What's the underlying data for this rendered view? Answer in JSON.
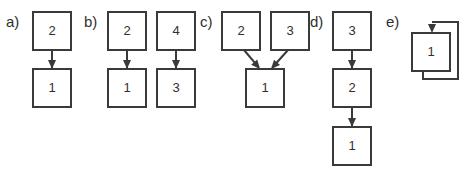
{
  "figure": {
    "background_color": "#ffffff",
    "stroke_color": "#3a3a3a",
    "text_color": "#2f2f2f",
    "panels": [
      {
        "label": "a)",
        "label_x": 6,
        "label_y": 27,
        "nodes": [
          {
            "id": "a2",
            "text": "2",
            "x": 33,
            "y": 12,
            "w": 38,
            "h": 38
          },
          {
            "id": "a1",
            "text": "1",
            "x": 33,
            "y": 69,
            "w": 38,
            "h": 38
          }
        ],
        "edges": [
          {
            "from": "a2",
            "to": "a1",
            "kind": "straight-down",
            "x": 52,
            "y1": 50,
            "y2": 69
          }
        ]
      },
      {
        "label": "b)",
        "label_x": 84,
        "label_y": 27,
        "nodes": [
          {
            "id": "b2",
            "text": "2",
            "x": 108,
            "y": 12,
            "w": 38,
            "h": 38
          },
          {
            "id": "b4",
            "text": "4",
            "x": 157,
            "y": 12,
            "w": 38,
            "h": 38
          },
          {
            "id": "b1",
            "text": "1",
            "x": 108,
            "y": 69,
            "w": 38,
            "h": 38
          },
          {
            "id": "b3",
            "text": "3",
            "x": 157,
            "y": 69,
            "w": 38,
            "h": 38
          }
        ],
        "edges": [
          {
            "from": "b2",
            "to": "b1",
            "kind": "straight-down",
            "x": 127,
            "y1": 50,
            "y2": 69
          },
          {
            "from": "b4",
            "to": "b3",
            "kind": "straight-down",
            "x": 176,
            "y1": 50,
            "y2": 69
          }
        ]
      },
      {
        "label": "c)",
        "label_x": 200,
        "label_y": 27,
        "nodes": [
          {
            "id": "c2",
            "text": "2",
            "x": 222,
            "y": 12,
            "w": 38,
            "h": 38
          },
          {
            "id": "c3",
            "text": "3",
            "x": 271,
            "y": 12,
            "w": 38,
            "h": 38
          },
          {
            "id": "c1",
            "text": "1",
            "x": 246,
            "y": 69,
            "w": 38,
            "h": 38
          }
        ],
        "edges": [
          {
            "from": "c2",
            "to": "c1",
            "kind": "diagonal",
            "x1": 244,
            "y1": 50,
            "x2": 260,
            "y2": 69
          },
          {
            "from": "c3",
            "to": "c1",
            "kind": "diagonal",
            "x1": 288,
            "y1": 50,
            "x2": 271,
            "y2": 69
          }
        ]
      },
      {
        "label": "d)",
        "label_x": 310,
        "label_y": 27,
        "nodes": [
          {
            "id": "d3",
            "text": "3",
            "x": 333,
            "y": 12,
            "w": 38,
            "h": 38
          },
          {
            "id": "d2",
            "text": "2",
            "x": 333,
            "y": 69,
            "w": 38,
            "h": 38
          },
          {
            "id": "d1",
            "text": "1",
            "x": 333,
            "y": 127,
            "w": 38,
            "h": 38
          }
        ],
        "edges": [
          {
            "from": "d3",
            "to": "d2",
            "kind": "straight-down",
            "x": 352,
            "y1": 50,
            "y2": 69
          },
          {
            "from": "d2",
            "to": "d1",
            "kind": "straight-down",
            "x": 352,
            "y1": 107,
            "y2": 127
          }
        ]
      },
      {
        "label": "e)",
        "label_x": 386,
        "label_y": 27,
        "nodes": [
          {
            "id": "e1",
            "text": "1",
            "x": 412,
            "y": 33,
            "w": 38,
            "h": 38
          }
        ],
        "edges": [
          {
            "from": "e1",
            "to": "e1",
            "kind": "self-loop",
            "path": "M 423 71 L 423 79 L 458 79 L 458 22 L 432 22",
            "head_x": 432,
            "head_y": 33
          }
        ]
      }
    ]
  }
}
